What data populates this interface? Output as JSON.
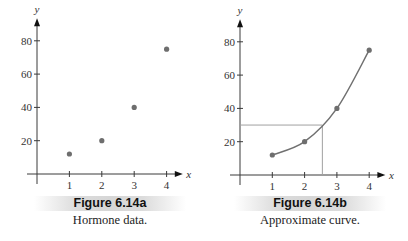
{
  "figures": [
    {
      "id": "6.14a",
      "caption_title": "Figure 6.14a",
      "caption_sub": "Hormone data."
    },
    {
      "id": "6.14b",
      "caption_title": "Figure 6.14b",
      "caption_sub": "Approximate curve."
    }
  ],
  "colors": {
    "axis": "#3a3a3a",
    "points": "#6e6e6e",
    "curve": "#707070",
    "guide": "#a0a0a0",
    "caption_band": "#d8d8d8"
  },
  "chart_data": [
    {
      "type": "scatter",
      "title": "Figure 6.14a",
      "subtitle": "Hormone data.",
      "xlabel": "x",
      "ylabel": "y",
      "x_ticks": [
        1,
        2,
        3,
        4
      ],
      "y_ticks": [
        20,
        40,
        60,
        80
      ],
      "xlim": [
        0,
        4.5
      ],
      "ylim": [
        0,
        90
      ],
      "grid": false,
      "series": [
        {
          "name": "Hormone data",
          "x": [
            1,
            2,
            3,
            4
          ],
          "y": [
            12,
            20,
            40,
            75
          ]
        }
      ]
    },
    {
      "type": "line",
      "title": "Figure 6.14b",
      "subtitle": "Approximate curve.",
      "xlabel": "x",
      "ylabel": "y",
      "x_ticks": [
        1,
        2,
        3,
        4
      ],
      "y_ticks": [
        20,
        40,
        60,
        80
      ],
      "xlim": [
        0,
        4.5
      ],
      "ylim": [
        0,
        90
      ],
      "grid": false,
      "series": [
        {
          "name": "Approximate curve",
          "x": [
            1,
            2,
            3,
            4
          ],
          "y": [
            12,
            20,
            40,
            75
          ],
          "markers": true,
          "smooth": true
        }
      ],
      "annotations": [
        {
          "type": "guide-lines",
          "x": 2.55,
          "y": 30,
          "description": "horizontal line from y-axis at y=30 to curve, vertical line down to x-axis"
        }
      ]
    }
  ]
}
